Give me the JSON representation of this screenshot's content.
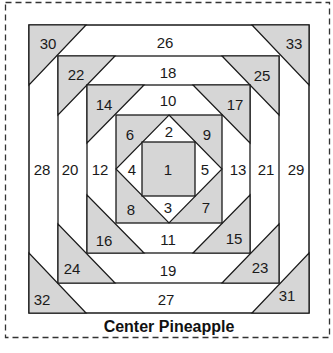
{
  "title": "Center Pineapple",
  "colors": {
    "gray_fill": "#d6d6d6",
    "white_fill": "#ffffff",
    "line": "#1a1a1a",
    "dashed_border": "#333333"
  },
  "pieces": {
    "p1": "1",
    "p2": "2",
    "p3": "3",
    "p4": "4",
    "p5": "5",
    "p6": "6",
    "p7": "7",
    "p8": "8",
    "p9": "9",
    "p10": "10",
    "p11": "11",
    "p12": "12",
    "p13": "13",
    "p14": "14",
    "p15": "15",
    "p16": "16",
    "p17": "17",
    "p18": "18",
    "p19": "19",
    "p20": "20",
    "p21": "21",
    "p22": "22",
    "p23": "23",
    "p24": "24",
    "p25": "25",
    "p26": "26",
    "p27": "27",
    "p28": "28",
    "p29": "29",
    "p30": "30",
    "p31": "31",
    "p32": "32",
    "p33": "33"
  }
}
